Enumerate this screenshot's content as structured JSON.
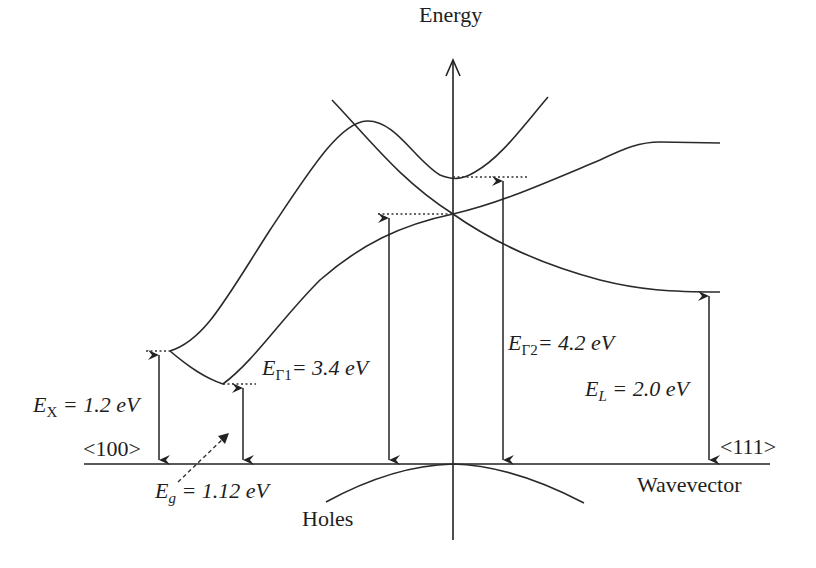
{
  "diagram": {
    "axes": {
      "vertical_label": "Energy",
      "horizontal_label": "Wavevector",
      "left_direction": "<100>",
      "right_direction": "<111>"
    },
    "annotations": {
      "ex": {
        "symbol": "E",
        "sub": "X",
        "value": "= 1.2 eV"
      },
      "eg": {
        "symbol": "E",
        "sub": "g",
        "value": "= 1.12 eV"
      },
      "eg1": {
        "symbol": "E",
        "sub": "Γ1",
        "value": "= 3.4 eV"
      },
      "eg2": {
        "symbol": "E",
        "sub": "Γ2",
        "value": "= 4.2 eV"
      },
      "el": {
        "symbol": "E",
        "sub": "L",
        "value": "= 2.0 eV"
      }
    },
    "band_labels": {
      "holes": "Holes"
    },
    "colors": {
      "line": "#222222",
      "background": "#ffffff"
    }
  }
}
